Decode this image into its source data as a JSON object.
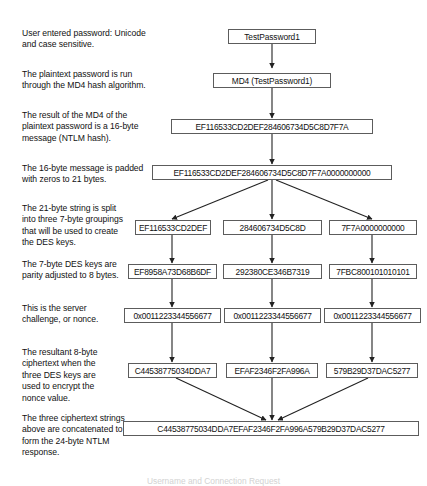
{
  "diagram": {
    "caption": "Username and Connection Request",
    "notes": [
      {
        "id": "note-password",
        "text": "User entered password: Unicode\nand case sensitive."
      },
      {
        "id": "note-md4",
        "text": "The plaintext password is run\nthrough the MD4 hash algorithm."
      },
      {
        "id": "note-ntlm-hash",
        "text": "The result of the MD4 of the\nplaintext password is a 16-byte\nmessage (NTLM hash)."
      },
      {
        "id": "note-padding",
        "text": "The 16-byte message is padded\nwith zeros to 21 bytes."
      },
      {
        "id": "note-split",
        "text": "The 21-byte string is split\ninto three 7-byte groupings\nthat will be used to create\nthe DES keys."
      },
      {
        "id": "note-des-keys",
        "text": "The 7-byte DES keys are\nparity adjusted to 8 bytes."
      },
      {
        "id": "note-challenge",
        "text": "This is the server\nchallenge, or nonce."
      },
      {
        "id": "note-ciphertext",
        "text": "The resultant 8-byte\nciphertext when the\nthree DES keys are\nused to encrypt the\nnonce value."
      },
      {
        "id": "note-concatenate",
        "text": "The three ciphertext strings\nabove are concatenated to\nform the 24-byte NTLM\nresponse."
      }
    ],
    "nodes": {
      "password": "TestPassword1",
      "md4_call": "MD4 (TestPassword1)",
      "ntlm_hash": "EF116533CD2DEF284606734D5C8D7F7A",
      "padded": "EF116533CD2DEF284606734D5C8D7F7A0000000000",
      "groupings": [
        "EF116533CD2DEF",
        "284606734D5C8D",
        "7F7A0000000000"
      ],
      "des_keys": [
        "EF8958A73D68B6DF",
        "292380CE346B7319",
        "7FBC800101010101"
      ],
      "nonces": [
        "0x0011223344556677",
        "0x0011223344556677",
        "0x0011223344556677"
      ],
      "ciphertexts": [
        "C44538775034DDA7",
        "EFAF2346F2FA996A",
        "579B29D37DAC5277"
      ],
      "ntlm_response": "C44538775034DDA7EFAF2346F2FA996A579B29D37DAC5277"
    }
  }
}
